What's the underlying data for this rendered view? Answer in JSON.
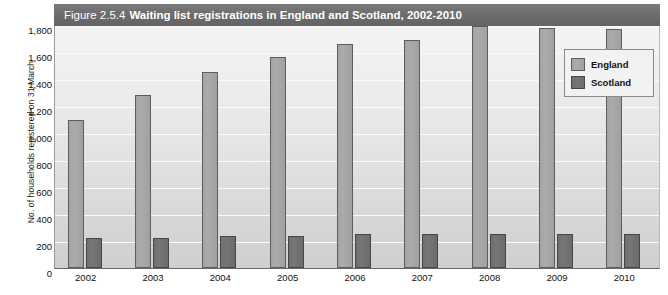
{
  "figure": {
    "title_prefix": "Figure 2.5.4",
    "title_main": "Waiting list registrations in England and Scotland, 2002-2010"
  },
  "axes": {
    "y_axis_label": "No. of households registered on 31 March",
    "y_ticks": [
      "0",
      "200",
      "400",
      "600",
      "800",
      "1,000",
      "1,200",
      "1,400",
      "1,600",
      "1,800"
    ],
    "x_ticks": [
      "2002",
      "2003",
      "2004",
      "2005",
      "2006",
      "2007",
      "2008",
      "2009",
      "2010"
    ]
  },
  "legend": {
    "items": [
      {
        "label": "England",
        "color": "#a8a8a8"
      },
      {
        "label": "Scotland",
        "color": "#6f6f6f"
      }
    ]
  },
  "chart_data": {
    "type": "bar",
    "title": "Figure 2.5.4 Waiting list registrations in England and Scotland, 2002-2010",
    "xlabel": "",
    "ylabel": "No. of households registered on 31 March",
    "categories": [
      "2002",
      "2003",
      "2004",
      "2005",
      "2006",
      "2007",
      "2008",
      "2009",
      "2010"
    ],
    "series": [
      {
        "name": "England",
        "color": "#a8a8a8",
        "values": [
          1100,
          1280,
          1450,
          1560,
          1660,
          1690,
          1790,
          1780,
          1770
        ]
      },
      {
        "name": "Scotland",
        "color": "#6f6f6f",
        "values": [
          225,
          225,
          240,
          240,
          255,
          250,
          255,
          250,
          255
        ]
      }
    ],
    "ylim": [
      0,
      1800
    ],
    "ytick_step": 200,
    "grid": true,
    "legend_position": "top-right"
  }
}
